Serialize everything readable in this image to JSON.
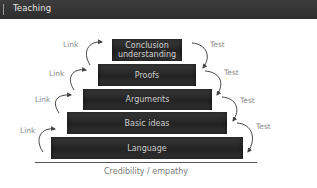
{
  "header": {
    "title": "Teaching"
  },
  "pyramid": {
    "levels": [
      {
        "label": "Conclusion understanding",
        "line1": "Conclusion",
        "line2": "understanding"
      },
      {
        "label": "Proofs"
      },
      {
        "label": "Arguments"
      },
      {
        "label": "Basic ideas"
      },
      {
        "label": "Language"
      }
    ],
    "left_labels": [
      "Link",
      "Link",
      "Link",
      "Link"
    ],
    "right_labels": [
      "Test",
      "Test",
      "Test",
      "Test"
    ],
    "base_caption": "Credibility / empathy"
  },
  "colors": {
    "titlebar": "#333333",
    "step": "#2a2a2a",
    "step_text": "#cfcfcf",
    "label": "#8a8a8a",
    "arrow": "#444444"
  }
}
